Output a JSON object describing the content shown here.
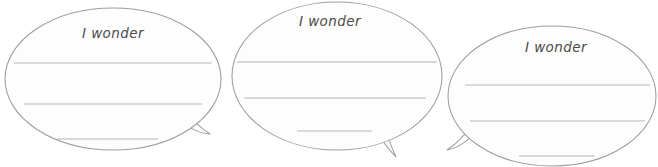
{
  "page": {
    "background_color": "#ffffff",
    "width": 658,
    "height": 167
  },
  "style": {
    "outline_color": "#9d9d9d",
    "line_color": "#b5b5b5",
    "text_color": "#4a4a4a",
    "fill_color": "#fdfdfd"
  },
  "bubbles": [
    {
      "id": "bubble-1",
      "prompt": "I wonder",
      "tail_direction": "bottom-right",
      "writing_lines": 3,
      "center_x": 113,
      "center_y": 79,
      "radius_x": 108,
      "radius_y": 71,
      "prompt_x": 113,
      "prompt_y": 38,
      "lines": [
        {
          "x1": 14,
          "x2": 212,
          "y": 63
        },
        {
          "x1": 24,
          "x2": 202,
          "y": 104
        },
        {
          "x1": 57,
          "x2": 158,
          "y": 139
        }
      ],
      "tail_path": "M 176 116 C 186 127, 198 133, 210 134 C 202 129, 193 121, 186 110 Z"
    },
    {
      "id": "bubble-2",
      "prompt": "I wonder",
      "tail_direction": "bottom-right",
      "writing_lines": 3,
      "center_x": 337,
      "center_y": 76,
      "radius_x": 105,
      "radius_y": 74,
      "prompt_x": 330,
      "prompt_y": 26,
      "lines": [
        {
          "x1": 237,
          "x2": 437,
          "y": 62
        },
        {
          "x1": 244,
          "x2": 426,
          "y": 98
        },
        {
          "x1": 297,
          "x2": 372,
          "y": 131
        }
      ],
      "tail_path": "M 372 123 C 380 138, 388 149, 396 157 C 390 144, 386 133, 383 118 Z"
    },
    {
      "id": "bubble-3",
      "prompt": "I wonder",
      "tail_direction": "bottom-left",
      "writing_lines": 3,
      "center_x": 552,
      "center_y": 96,
      "radius_x": 104,
      "radius_y": 70,
      "prompt_x": 556,
      "prompt_y": 52,
      "lines": [
        {
          "x1": 465,
          "x2": 650,
          "y": 85
        },
        {
          "x1": 470,
          "x2": 645,
          "y": 121
        },
        {
          "x1": 519,
          "x2": 595,
          "y": 156
        }
      ],
      "tail_path": "M 478 129 C 468 142, 457 148, 447 150 C 456 144, 465 136, 472 124 Z"
    }
  ]
}
